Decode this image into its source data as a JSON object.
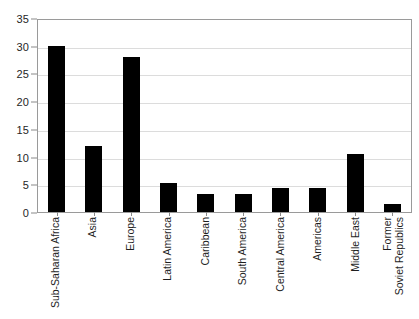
{
  "chart_data": {
    "type": "bar",
    "title": "",
    "subtitle": "",
    "xlabel": "",
    "ylabel": "",
    "ylim": [
      0,
      35
    ],
    "yticks": [
      0,
      5,
      10,
      15,
      20,
      25,
      30,
      35
    ],
    "ytick_labels": [
      "0",
      "5",
      "10",
      "15",
      "20",
      "25",
      "30",
      "35"
    ],
    "grid": "horizontal",
    "legend": "none",
    "bar_color": "#000000",
    "gridline_color": "#dcdcdc",
    "axis_color": "#9a9a9a",
    "categories": [
      "Sub-Saharan Africa",
      "Asia",
      "Europe",
      "Latin America",
      "Caribbean",
      "South America",
      "Central America",
      "Americas",
      "Middle East",
      "Former Soviet Republics"
    ],
    "category_lines": [
      [
        "Sub-Saharan Africa"
      ],
      [
        "Asia"
      ],
      [
        "Europe"
      ],
      [
        "Latin America"
      ],
      [
        "Caribbean"
      ],
      [
        "South America"
      ],
      [
        "Central America"
      ],
      [
        "Americas"
      ],
      [
        "Middle East"
      ],
      [
        "Former",
        "Soviet Republics"
      ]
    ],
    "values": [
      30,
      12,
      28,
      5.2,
      3.2,
      3.3,
      4.3,
      4.4,
      10.4,
      1.5
    ]
  }
}
